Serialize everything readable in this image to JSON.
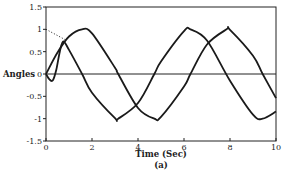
{
  "chart_data": {
    "type": "line",
    "title": "",
    "caption": "(a)",
    "xlabel": "Time (Sec)",
    "ylabel": "Angles",
    "xlim": [
      0,
      10
    ],
    "ylim": [
      -1.5,
      1.5
    ],
    "xticks": [
      0,
      2,
      4,
      6,
      8,
      10
    ],
    "yticks": [
      1.5,
      1,
      0.5,
      0,
      -0.5,
      -1,
      -1.5
    ],
    "ytick_labels": [
      "1.5",
      "1",
      "0.5",
      "0",
      "-0.5",
      "-1",
      "-1.5"
    ],
    "grid": false,
    "zero_line": true,
    "legend": null,
    "series": [
      {
        "name": "angle 1",
        "style": "solid",
        "x": [
          0,
          0.5,
          1,
          1.57,
          2,
          3,
          3.14,
          4,
          4.71,
          5,
          6,
          6.28,
          7,
          7.85,
          8,
          9,
          9.42,
          10
        ],
        "values": [
          0,
          0.48,
          0.84,
          1.0,
          0.91,
          0.14,
          0,
          -0.76,
          -1.0,
          -0.96,
          -0.28,
          0,
          0.66,
          1.0,
          0.99,
          0.41,
          0,
          -0.54
        ]
      },
      {
        "name": "angle 2",
        "style": "solid",
        "x": [
          0,
          0.15,
          0.3,
          0.45,
          0.6,
          0.75,
          1,
          1.57,
          2,
          3,
          3.14,
          4,
          4.71,
          5,
          6,
          6.28,
          7,
          8,
          9,
          9.42,
          10
        ],
        "values": [
          0,
          -0.12,
          -0.14,
          0.1,
          0.5,
          0.73,
          0.54,
          0,
          -0.42,
          -0.99,
          -1.0,
          -0.65,
          0,
          0.28,
          0.96,
          1.0,
          0.75,
          -0.15,
          -0.91,
          -1.0,
          -0.84
        ]
      },
      {
        "name": "reference (dotted)",
        "style": "dotted",
        "x": [
          0,
          0.9
        ],
        "values": [
          1.0,
          0.75
        ]
      }
    ]
  }
}
